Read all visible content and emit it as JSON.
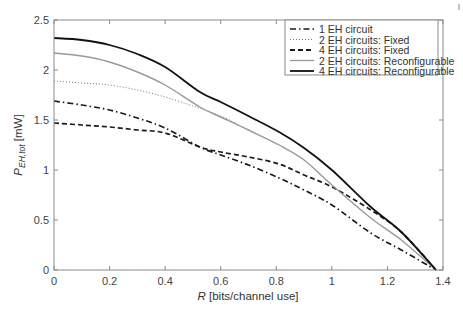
{
  "chart_data": {
    "type": "line",
    "title": "",
    "xlabel": "R [bits/channel use]",
    "xlabel_italic_part": "R",
    "xlabel_rest": " [bits/channel use]",
    "ylabel": "P_EH,tot [mW]",
    "ylabel_main": "P",
    "ylabel_sub": "EH,tot",
    "ylabel_unit": " [mW]",
    "xlim": [
      0,
      1.4
    ],
    "ylim": [
      0,
      2.5
    ],
    "xticks": [
      0,
      0.2,
      0.4,
      0.6,
      0.8,
      1,
      1.2,
      1.4
    ],
    "xtick_labels": [
      "0",
      "0.2",
      "0.4",
      "0.6",
      "0.8",
      "1",
      "1.2",
      "1.4"
    ],
    "yticks": [
      0,
      0.5,
      1,
      1.5,
      2,
      2.5
    ],
    "ytick_labels": [
      "0",
      "0.5",
      "1",
      "1.5",
      "2",
      "2.5"
    ],
    "grid": false,
    "legend_position": "upper right",
    "series": [
      {
        "name": "1 EH circuit",
        "style": "dashdot",
        "color": "#1a1a1a",
        "x": [
          0,
          0.1,
          0.2,
          0.3,
          0.4,
          0.525,
          0.6,
          0.7,
          0.81,
          0.9,
          1.0,
          1.14,
          1.25,
          1.375
        ],
        "y": [
          1.69,
          1.65,
          1.6,
          1.52,
          1.42,
          1.23,
          1.15,
          1.05,
          0.92,
          0.8,
          0.65,
          0.37,
          0.2,
          0.0
        ]
      },
      {
        "name": "2 EH circuits: Fixed",
        "style": "dotted",
        "color": "#777777",
        "x": [
          0,
          0.1,
          0.2,
          0.3,
          0.4,
          0.5,
          0.6,
          0.66
        ],
        "y": [
          1.89,
          1.87,
          1.85,
          1.8,
          1.73,
          1.64,
          1.54,
          1.46
        ]
      },
      {
        "name": "4 EH circuits: Fixed",
        "style": "dashed",
        "color": "#1a1a1a",
        "x": [
          0,
          0.1,
          0.2,
          0.3,
          0.4,
          0.525,
          0.6,
          0.7,
          0.81,
          0.9,
          1.0,
          1.14,
          1.25,
          1.375
        ],
        "y": [
          1.47,
          1.45,
          1.43,
          1.4,
          1.37,
          1.23,
          1.18,
          1.13,
          1.06,
          0.95,
          0.83,
          0.6,
          0.38,
          0.0
        ]
      },
      {
        "name": "2 EH circuits: Reconfigurable",
        "style": "solid",
        "color": "#999999",
        "x": [
          0,
          0.1,
          0.2,
          0.3,
          0.4,
          0.525,
          0.6,
          0.7,
          0.81,
          0.9,
          1.0,
          1.14,
          1.25,
          1.375
        ],
        "y": [
          2.17,
          2.14,
          2.08,
          1.98,
          1.85,
          1.63,
          1.53,
          1.4,
          1.25,
          1.1,
          0.85,
          0.52,
          0.3,
          0.0
        ]
      },
      {
        "name": "4 EH circuits: Reconfigurable",
        "style": "solid",
        "color": "#111111",
        "x": [
          0,
          0.1,
          0.2,
          0.3,
          0.4,
          0.525,
          0.6,
          0.7,
          0.81,
          0.9,
          1.0,
          1.14,
          1.25,
          1.375
        ],
        "y": [
          2.32,
          2.3,
          2.25,
          2.16,
          2.03,
          1.78,
          1.68,
          1.54,
          1.38,
          1.22,
          1.0,
          0.63,
          0.38,
          0.0
        ]
      }
    ]
  },
  "legend": {
    "items": [
      {
        "label": "1 EH circuit"
      },
      {
        "label": "2 EH circuits: Fixed"
      },
      {
        "label": "4 EH circuits: Fixed"
      },
      {
        "label": "2 EH circuits: Reconfigurable"
      },
      {
        "label": "4 EH circuits: Reconfigurable"
      }
    ]
  },
  "colors": {
    "axis": "#7a7a7a",
    "text": "#444444",
    "background": "#ffffff"
  }
}
